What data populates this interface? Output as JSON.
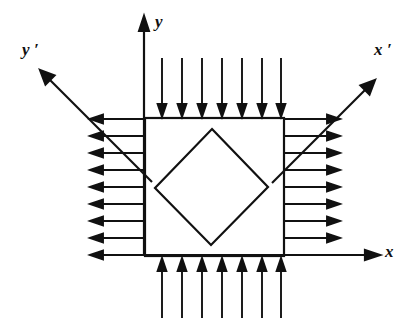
{
  "figure": {
    "background_color": "#ffffff",
    "line_color": "#111111",
    "labels": {
      "y": "y",
      "x": "x",
      "x_prime": "x ′",
      "y_prime": "y ′"
    },
    "shapes": {
      "square": {
        "name": "stress-element-square",
        "left": 145,
        "top": 118,
        "right": 284,
        "bottom": 256
      },
      "diamond": {
        "name": "inscribed-rotated-square",
        "vertices": [
          [
            212,
            129
          ],
          [
            268,
            187
          ],
          [
            211,
            245
          ],
          [
            155,
            188
          ]
        ]
      }
    },
    "axes": [
      {
        "name": "y-axis",
        "from": [
          144,
          256
        ],
        "to": [
          144,
          17
        ],
        "arrow": "up"
      },
      {
        "name": "x-axis",
        "from": [
          145,
          255
        ],
        "to": [
          379,
          255
        ],
        "arrow": "right"
      },
      {
        "name": "x-prime-axis",
        "from": [
          272,
          183
        ],
        "to": [
          375,
          80
        ],
        "arrow": "up-right"
      },
      {
        "name": "y-prime-axis",
        "from": [
          152,
          182
        ],
        "to": [
          40,
          70
        ],
        "arrow": "up-left"
      }
    ],
    "load_arrows": {
      "top": {
        "name": "top-compression-arrows",
        "count": 7,
        "direction": "down",
        "tail_y": 58,
        "head_y": 116
      },
      "bottom": {
        "name": "bottom-compression-arrows",
        "count": 7,
        "direction": "up",
        "tail_y": 318,
        "head_y": 259
      },
      "left": {
        "name": "left-tension-arrows",
        "count": 9,
        "direction": "left",
        "tail_x": 144,
        "head_x": 90
      },
      "right": {
        "name": "right-tension-arrows",
        "count": 9,
        "direction": "right",
        "tail_x": 285,
        "head_x": 340
      }
    }
  }
}
